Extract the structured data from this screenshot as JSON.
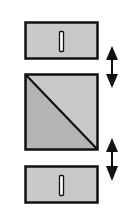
{
  "diagram": {
    "colors": {
      "background": "#ffffff",
      "panel_fill": "#c8c8c8",
      "square_upper_fill": "#c9c9c9",
      "square_lower_fill": "#b4b4b4",
      "stroke": "#111111",
      "handle_fill": "#ffffff"
    },
    "elements": [
      {
        "id": "top-panel",
        "type": "rect-with-handle"
      },
      {
        "id": "upper-arrow",
        "type": "double-arrow-vertical"
      },
      {
        "id": "middle-square",
        "type": "diagonal-split-square"
      },
      {
        "id": "lower-arrow",
        "type": "double-arrow-vertical"
      },
      {
        "id": "bottom-panel",
        "type": "rect-with-handle"
      }
    ]
  }
}
